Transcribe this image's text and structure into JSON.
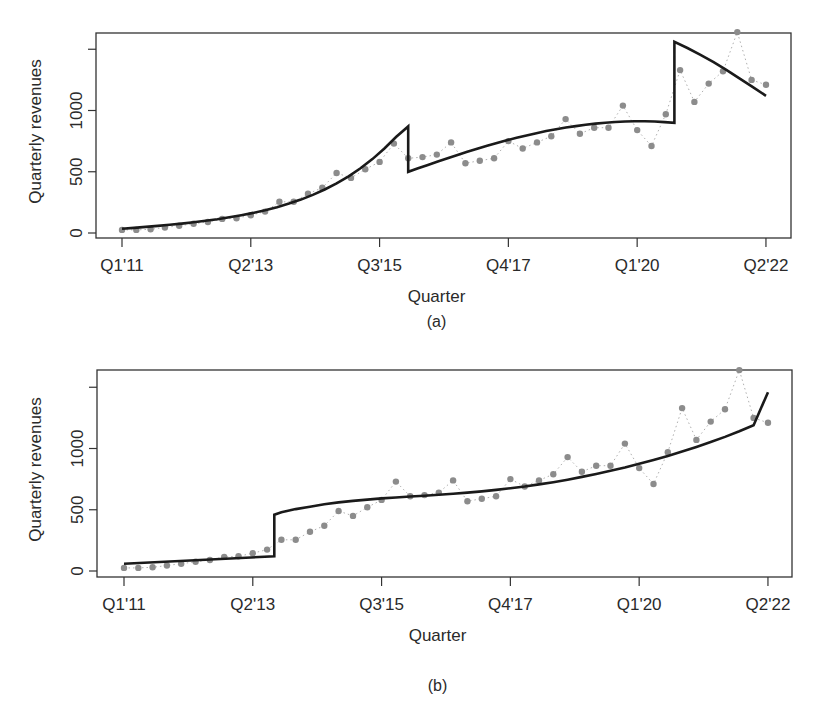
{
  "figure": {
    "panels": [
      {
        "id": "a",
        "caption": "(a)",
        "xlabel": "Quarter",
        "ylabel": "Quarterly revenues"
      },
      {
        "id": "b",
        "caption": "(b)",
        "xlabel": "Quarter",
        "ylabel": "Quarterly revenues"
      }
    ],
    "colors": {
      "fit_line": "#1a1a1a",
      "points": "#8c8c8c",
      "dotted": "#b0b0b0",
      "axis": "#333333"
    }
  },
  "chart_data": [
    {
      "type": "line",
      "title": "(a)",
      "xlabel": "Quarter",
      "ylabel": "Quarterly revenues",
      "x_tick_labels": [
        "Q1'11",
        "Q2'13",
        "Q3'15",
        "Q4'17",
        "Q1'20",
        "Q2'22"
      ],
      "x_tick_index": [
        0,
        9,
        18,
        27,
        36,
        45
      ],
      "y_ticks": [
        0,
        500,
        1000,
        1500
      ],
      "y_tick_labels": [
        "0",
        "500",
        "1000",
        ""
      ],
      "ylim": [
        -15,
        1600
      ],
      "grid": false,
      "series": [
        {
          "name": "Observed quarterly revenues",
          "style": "points-dotted",
          "values": [
            25,
            25,
            30,
            45,
            60,
            75,
            90,
            115,
            120,
            145,
            175,
            255,
            255,
            320,
            370,
            490,
            450,
            520,
            580,
            730,
            610,
            620,
            640,
            740,
            570,
            590,
            610,
            750,
            690,
            740,
            790,
            930,
            810,
            860,
            860,
            1040,
            840,
            710,
            970,
            1330,
            1070,
            1220,
            1320,
            1640,
            1250,
            1210
          ]
        },
        {
          "name": "Piecewise fit",
          "style": "line",
          "segments": [
            {
              "start": 0,
              "values": [
                35,
                42,
                50,
                58,
                67,
                77,
                88,
                100,
                113,
                128,
                145,
                164,
                186,
                211,
                240,
                273,
                311,
                355,
                405,
                462,
                528,
                603,
                690,
                785,
                870
              ]
            },
            {
              "start": 24,
              "values": [
                500,
                528,
                556,
                583,
                610,
                637,
                663,
                688,
                712,
                735,
                757,
                778,
                797,
                815,
                832,
                847,
                861,
                873,
                884,
                893,
                900,
                906,
                910,
                912,
                912,
                910,
                905,
                900
              ]
            },
            {
              "start": 51,
              "values": [
                1560,
                1510,
                1455,
                1395,
                1330,
                1260,
                1190,
                1120
              ]
            }
          ],
          "note": "fit curve drawn as three segments with jumps at ~Q4'15 and ~Q4'20"
        }
      ]
    },
    {
      "type": "line",
      "title": "(b)",
      "xlabel": "Quarter",
      "ylabel": "Quarterly revenues",
      "x_tick_labels": [
        "Q1'11",
        "Q2'13",
        "Q3'15",
        "Q4'17",
        "Q1'20",
        "Q2'22"
      ],
      "x_tick_index": [
        0,
        9,
        18,
        27,
        36,
        45
      ],
      "y_ticks": [
        0,
        500,
        1000,
        1500
      ],
      "y_tick_labels": [
        "0",
        "500",
        "1000",
        ""
      ],
      "ylim": [
        -15,
        1600
      ],
      "grid": false,
      "series": [
        {
          "name": "Observed quarterly revenues",
          "style": "points-dotted",
          "values": [
            25,
            25,
            30,
            45,
            60,
            75,
            90,
            115,
            120,
            145,
            175,
            255,
            255,
            320,
            370,
            490,
            450,
            520,
            580,
            730,
            610,
            620,
            640,
            740,
            570,
            590,
            610,
            750,
            690,
            740,
            790,
            930,
            810,
            860,
            860,
            1040,
            840,
            710,
            970,
            1330,
            1070,
            1220,
            1320,
            1640,
            1250,
            1210
          ]
        },
        {
          "name": "Fit with level shift",
          "style": "line",
          "segments": [
            {
              "start": 0,
              "x": [
                0,
                10.5
              ],
              "values": [
                60,
                120
              ]
            },
            {
              "start": 10.5,
              "x": [
                10.5,
                11,
                12,
                13,
                14,
                15,
                16,
                17,
                18,
                19,
                20,
                21,
                22,
                23,
                24,
                25,
                26,
                27,
                28,
                29,
                30,
                31,
                32,
                33,
                34,
                35,
                36,
                37,
                38,
                39,
                40,
                41,
                42,
                43,
                44,
                45
              ],
              "values": [
                460,
                480,
                505,
                525,
                545,
                560,
                572,
                583,
                593,
                600,
                608,
                615,
                622,
                630,
                640,
                650,
                662,
                676,
                690,
                707,
                725,
                745,
                768,
                792,
                818,
                845,
                875,
                907,
                940,
                975,
                1012,
                1052,
                1095,
                1140,
                1190,
                1460
              ]
            }
          ],
          "note": "fit curve drawn with a single level shift at ~Q4'13"
        }
      ]
    }
  ]
}
